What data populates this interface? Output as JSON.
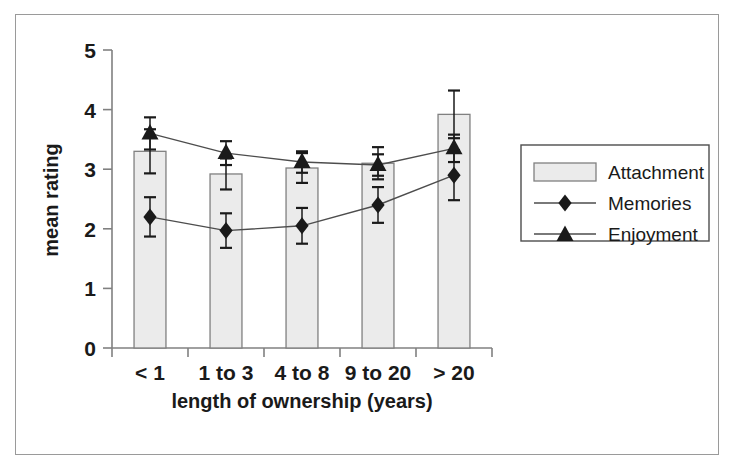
{
  "chart_data": {
    "type": "bar",
    "title": "",
    "xlabel": "length of ownership (years)",
    "ylabel": "mean rating",
    "categories": [
      "< 1",
      "1 to 3",
      "4 to 8",
      "9 to 20",
      "> 20"
    ],
    "ylim": [
      0,
      5
    ],
    "yticks": [
      0,
      1,
      2,
      3,
      4,
      5
    ],
    "ytick_labels": [
      "0",
      "1",
      "2",
      "3",
      "4",
      "5"
    ],
    "grid": false,
    "legend_position": "right",
    "series": [
      {
        "name": "Attachment",
        "kind": "bar",
        "marker": "bar-swatch",
        "values": [
          3.3,
          2.92,
          3.02,
          3.1,
          3.92
        ],
        "errors_low": [
          0.37,
          0.26,
          0.25,
          0.27,
          0.4
        ],
        "errors_high": [
          0.37,
          0.26,
          0.25,
          0.27,
          0.4
        ]
      },
      {
        "name": "Memories",
        "kind": "line",
        "marker": "diamond",
        "values": [
          2.2,
          1.97,
          2.05,
          2.4,
          2.9
        ],
        "errors_low": [
          0.33,
          0.29,
          0.3,
          0.3,
          0.42
        ],
        "errors_high": [
          0.33,
          0.29,
          0.3,
          0.3,
          0.42
        ]
      },
      {
        "name": "Enjoyment",
        "kind": "line",
        "marker": "triangle",
        "values": [
          3.6,
          3.27,
          3.12,
          3.07,
          3.35
        ],
        "errors_low": [
          0.27,
          0.2,
          0.18,
          0.18,
          0.23
        ],
        "errors_high": [
          0.27,
          0.2,
          0.18,
          0.18,
          0.23
        ]
      }
    ]
  },
  "legend": {
    "entries": [
      {
        "label": "Attachment",
        "icon": "bar-swatch-icon"
      },
      {
        "label": "Memories",
        "icon": "diamond-marker-icon"
      },
      {
        "label": "Enjoyment",
        "icon": "triangle-marker-icon"
      }
    ]
  },
  "colors": {
    "bar_fill": "#ebebeb",
    "bar_stroke": "#808080",
    "marker": "#1a1a1a",
    "line": "#4d4d4d",
    "axis": "#808080",
    "text": "#1a1a1a",
    "frame": "#9a9a9a"
  }
}
